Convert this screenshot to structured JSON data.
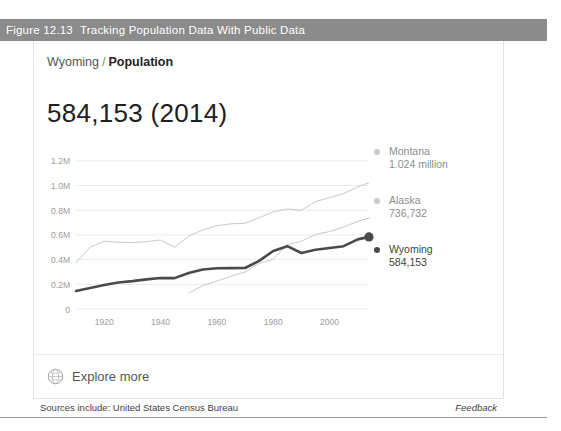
{
  "figure": {
    "number": "Figure 12.13",
    "title": "Tracking Population Data With Public Data",
    "bar_color": "#8b8b8b"
  },
  "card": {
    "breadcrumb": {
      "region": "Wyoming",
      "separator": "/",
      "metric": "Population"
    },
    "headline_value": "584,153 (2014)",
    "explore": {
      "label": "Explore more",
      "icon": "globe-icon"
    }
  },
  "footer": {
    "sources": "Sources include: United States Census Bureau",
    "feedback": "Feedback"
  },
  "chart_data": {
    "type": "line",
    "title": "",
    "xlabel": "",
    "ylabel": "",
    "xlim": [
      1910,
      2014
    ],
    "ylim": [
      0,
      1280000
    ],
    "grid": true,
    "legend_position": "right",
    "x_ticks": [
      "1920",
      "1940",
      "1960",
      "1980",
      "2000"
    ],
    "x_tick_values": [
      1920,
      1940,
      1960,
      1980,
      2000
    ],
    "y_ticks": [
      "0",
      "0.2M",
      "0.4M",
      "0.6M",
      "0.8M",
      "1.0M",
      "1.2M"
    ],
    "y_tick_values": [
      0,
      200000,
      400000,
      600000,
      800000,
      1000000,
      1200000
    ],
    "series": [
      {
        "name": "Montana",
        "value_label": "1.024 million",
        "final_value": 1024000,
        "color": "#c9c9c9",
        "emphasis": false,
        "x": [
          1910,
          1915,
          1918,
          1920,
          1925,
          1930,
          1935,
          1940,
          1945,
          1950,
          1955,
          1960,
          1965,
          1970,
          1975,
          1980,
          1985,
          1990,
          1995,
          2000,
          2005,
          2010,
          2014
        ],
        "values": [
          376000,
          500000,
          530000,
          549000,
          540000,
          538000,
          545000,
          559000,
          500000,
          591000,
          640000,
          675000,
          690000,
          694000,
          740000,
          787000,
          810000,
          799000,
          870000,
          902000,
          935000,
          989000,
          1024000
        ]
      },
      {
        "name": "Alaska",
        "value_label": "736,732",
        "final_value": 736732,
        "color": "#c9c9c9",
        "emphasis": false,
        "x": [
          1950,
          1955,
          1960,
          1965,
          1970,
          1975,
          1980,
          1985,
          1990,
          1995,
          2000,
          2005,
          2010,
          2014
        ],
        "values": [
          128000,
          190000,
          226000,
          265000,
          300000,
          370000,
          402000,
          521000,
          550000,
          604000,
          627000,
          664000,
          710000,
          736732
        ]
      },
      {
        "name": "Wyoming",
        "value_label": "584,153",
        "final_value": 584153,
        "color": "#4a4a4a",
        "emphasis": true,
        "end_marker": true,
        "x": [
          1910,
          1915,
          1920,
          1925,
          1930,
          1935,
          1940,
          1945,
          1950,
          1955,
          1960,
          1965,
          1970,
          1975,
          1980,
          1985,
          1990,
          1995,
          2000,
          2005,
          2010,
          2014
        ],
        "values": [
          146000,
          170000,
          194000,
          215000,
          226000,
          240000,
          251000,
          250000,
          291000,
          320000,
          330000,
          331000,
          332000,
          390000,
          470000,
          509000,
          454000,
          480000,
          494000,
          509000,
          564000,
          584153
        ]
      }
    ]
  }
}
